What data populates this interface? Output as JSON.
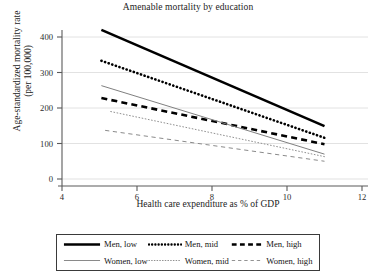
{
  "chart_data": {
    "type": "line",
    "title": "Amenable mortality by education",
    "xlabel": "Health care expenditure as % of GDP",
    "ylabel": "Age-standardized mortality rate\n(per 100,000)",
    "ylabel_line1": "Age-standardized mortality rate",
    "ylabel_line2": "(per 100,000)",
    "xlim": [
      4,
      12
    ],
    "ylim": [
      0,
      440
    ],
    "xticks": [
      4,
      6,
      8,
      10,
      12
    ],
    "yticks": [
      0,
      100,
      200,
      300,
      400
    ],
    "xtick_labels": [
      "4",
      "6",
      "8",
      "10",
      "12"
    ],
    "ytick_labels": [
      "0",
      "100",
      "200",
      "300",
      "400"
    ],
    "grid": "horizontal",
    "legend_position": "below-plot",
    "series": [
      {
        "name": "Men, low",
        "style": "solid",
        "weight": "thick",
        "color": "#000000",
        "x": [
          5.05,
          11.0
        ],
        "values": [
          420,
          149
        ]
      },
      {
        "name": "Men, mid",
        "style": "dotted",
        "weight": "thick",
        "color": "#000000",
        "x": [
          5.05,
          11.0
        ],
        "values": [
          333,
          116
        ]
      },
      {
        "name": "Men, high",
        "style": "dashed",
        "weight": "thick",
        "color": "#000000",
        "x": [
          5.05,
          11.0
        ],
        "values": [
          228,
          98
        ]
      },
      {
        "name": "Women, low",
        "style": "solid",
        "weight": "thin",
        "color": "#808080",
        "x": [
          5.05,
          11.0
        ],
        "values": [
          263,
          70
        ]
      },
      {
        "name": "Women, mid",
        "style": "dotted",
        "weight": "thin",
        "color": "#909090",
        "x": [
          5.3,
          11.0
        ],
        "values": [
          190,
          63
        ]
      },
      {
        "name": "Women, high",
        "style": "dashed",
        "weight": "thin",
        "color": "#8a8a8a",
        "x": [
          5.15,
          11.0
        ],
        "values": [
          137,
          50
        ]
      }
    ],
    "legend": [
      {
        "label": "Men, low",
        "style": "solid",
        "weight": "thick"
      },
      {
        "label": "Men, mid",
        "style": "dotted",
        "weight": "thick"
      },
      {
        "label": "Men, high",
        "style": "dashed",
        "weight": "thick"
      },
      {
        "label": "Women, low",
        "style": "solid",
        "weight": "thin"
      },
      {
        "label": "Women, mid",
        "style": "dotted",
        "weight": "thin"
      },
      {
        "label": "Women, high",
        "style": "dashed",
        "weight": "thin"
      }
    ]
  },
  "colors": {
    "men": "#000000",
    "women": "#808080",
    "axis": "#555555",
    "grid": "#e2e2e2",
    "background": "#ffffff"
  }
}
